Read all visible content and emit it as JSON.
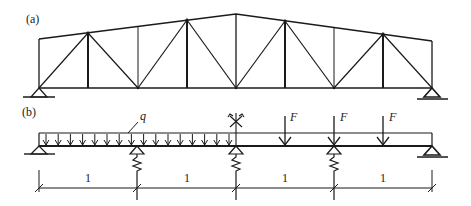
{
  "figure": {
    "panel_a": {
      "label": "(a)",
      "description": "Planar truss with sloped top chord, 8 panels, pinned support at left and roller at right",
      "bottom_chord_y": 88,
      "panel_x": [
        39,
        88,
        138,
        187,
        236,
        285,
        334,
        383,
        432
      ],
      "top_chord_y": [
        39,
        33,
        27,
        20,
        14,
        21,
        28,
        34,
        41
      ]
    },
    "panel_b": {
      "label": "(b)",
      "load_label": "q",
      "force_label": "F",
      "force_labels": [
        "F",
        "F",
        "F"
      ],
      "span_labels": [
        "1",
        "1",
        "1",
        "1"
      ],
      "supports": [
        "pin",
        "spring",
        "spring-rotation",
        "spring",
        "roller"
      ],
      "description": "Continuous beam on pinned end, three elastic spring supports and roller end; uniform load q on left half, three point forces F on right half"
    }
  }
}
